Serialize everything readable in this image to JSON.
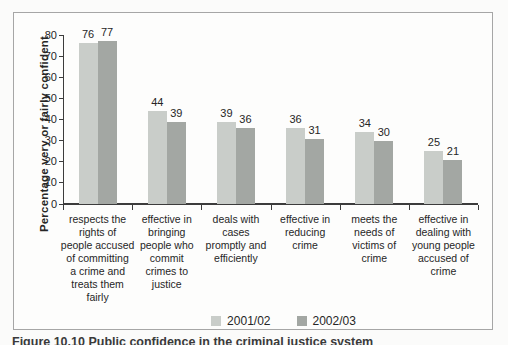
{
  "figure": {
    "caption": "Figure 10.10 Public confidence in the criminal justice system"
  },
  "chart_data": {
    "type": "bar",
    "title": "",
    "xlabel": "",
    "ylabel": "Percentage very or fairly confident",
    "ylim": [
      0,
      80
    ],
    "y_ticks": [
      0,
      10,
      20,
      30,
      40,
      50,
      60,
      70,
      80
    ],
    "grid": false,
    "legend_position": "bottom-center",
    "bar_value_labels": true,
    "categories": [
      "respects the rights of people accused of committing a crime and treats them fairly",
      "effective in bringing people who commit crimes to justice",
      "deals with cases promptly and efficiently",
      "effective in reducing crime",
      "meets the needs of victims of crime",
      "effective in dealing with young people accused of crime"
    ],
    "category_lines": [
      [
        "respects the",
        "rights of",
        "people accused",
        "of committing",
        "a crime and",
        "treats them",
        "fairly"
      ],
      [
        "effective in",
        "bringing",
        "people who",
        "commit",
        "crimes to",
        "justice"
      ],
      [
        "deals with",
        "cases",
        "promptly and",
        "efficiently"
      ],
      [
        "effective in",
        "reducing",
        "crime"
      ],
      [
        "meets the",
        "needs of",
        "victims of",
        "crime"
      ],
      [
        "effective in",
        "dealing with",
        "young people",
        "accused of",
        "crime"
      ]
    ],
    "series": [
      {
        "name": "2001/02",
        "color": "#c9cdc9",
        "values": [
          76,
          44,
          39,
          36,
          34,
          25
        ]
      },
      {
        "name": "2002/03",
        "color": "#a3a7a3",
        "values": [
          77,
          39,
          36,
          31,
          30,
          21
        ]
      }
    ],
    "colors": {
      "axis": "#3c3c3c",
      "text": "#262626",
      "box_border": "#a6a6a6",
      "background": "#fdfdfc"
    }
  }
}
